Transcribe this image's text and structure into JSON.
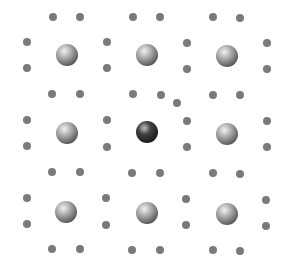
{
  "diagram": {
    "type": "crystal-lattice-defect",
    "colors": {
      "host_atom": "#a6a6a6",
      "host_atom_highlight": "#f2f2f2",
      "host_atom_shadow": "#4a4a4a",
      "substituted_atom": "#404040",
      "substituted_highlight": "#bdbdbd",
      "substituted_shadow": "#151515",
      "small_atom": "#7a7a7a",
      "background": "#ffffff"
    },
    "large_atom_radius": 11,
    "small_atom_radius": 4,
    "large_atoms": [
      {
        "x": 67,
        "y": 55,
        "kind": "host"
      },
      {
        "x": 147,
        "y": 55,
        "kind": "host"
      },
      {
        "x": 227,
        "y": 56,
        "kind": "host"
      },
      {
        "x": 67,
        "y": 133,
        "kind": "host"
      },
      {
        "x": 147,
        "y": 132,
        "kind": "substituted"
      },
      {
        "x": 227,
        "y": 134,
        "kind": "host"
      },
      {
        "x": 66,
        "y": 212,
        "kind": "host"
      },
      {
        "x": 147,
        "y": 213,
        "kind": "host"
      },
      {
        "x": 227,
        "y": 214,
        "kind": "host"
      }
    ],
    "small_atoms": [
      {
        "x": 53,
        "y": 17
      },
      {
        "x": 80,
        "y": 17
      },
      {
        "x": 133,
        "y": 17
      },
      {
        "x": 160,
        "y": 17
      },
      {
        "x": 213,
        "y": 17
      },
      {
        "x": 240,
        "y": 18
      },
      {
        "x": 27,
        "y": 42
      },
      {
        "x": 107,
        "y": 42
      },
      {
        "x": 187,
        "y": 43
      },
      {
        "x": 267,
        "y": 43
      },
      {
        "x": 27,
        "y": 68
      },
      {
        "x": 107,
        "y": 68
      },
      {
        "x": 187,
        "y": 69
      },
      {
        "x": 267,
        "y": 69
      },
      {
        "x": 52,
        "y": 94
      },
      {
        "x": 80,
        "y": 94
      },
      {
        "x": 133,
        "y": 94
      },
      {
        "x": 161,
        "y": 95
      },
      {
        "x": 213,
        "y": 95
      },
      {
        "x": 240,
        "y": 95
      },
      {
        "x": 27,
        "y": 120
      },
      {
        "x": 107,
        "y": 120
      },
      {
        "x": 187,
        "y": 121
      },
      {
        "x": 267,
        "y": 121
      },
      {
        "x": 27,
        "y": 146
      },
      {
        "x": 107,
        "y": 147
      },
      {
        "x": 187,
        "y": 147
      },
      {
        "x": 267,
        "y": 147
      },
      {
        "x": 52,
        "y": 172
      },
      {
        "x": 80,
        "y": 172
      },
      {
        "x": 132,
        "y": 173
      },
      {
        "x": 160,
        "y": 173
      },
      {
        "x": 213,
        "y": 173
      },
      {
        "x": 240,
        "y": 174
      },
      {
        "x": 27,
        "y": 198
      },
      {
        "x": 106,
        "y": 198
      },
      {
        "x": 186,
        "y": 199
      },
      {
        "x": 266,
        "y": 200
      },
      {
        "x": 27,
        "y": 224
      },
      {
        "x": 106,
        "y": 225
      },
      {
        "x": 186,
        "y": 225
      },
      {
        "x": 266,
        "y": 226
      },
      {
        "x": 52,
        "y": 249
      },
      {
        "x": 80,
        "y": 249
      },
      {
        "x": 132,
        "y": 250
      },
      {
        "x": 160,
        "y": 250
      },
      {
        "x": 213,
        "y": 250
      },
      {
        "x": 240,
        "y": 251
      }
    ],
    "interstitial_defect": {
      "x": 177,
      "y": 103
    }
  }
}
